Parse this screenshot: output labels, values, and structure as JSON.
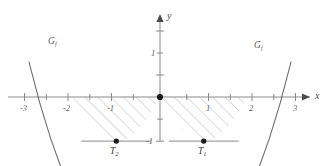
{
  "figure": {
    "background_color": "#ffffff",
    "axis_color": "#8a8a8a",
    "curve_color": "#6e6e6e",
    "hatch_color": "#9a9a9a",
    "point_color": "#1b1b1b"
  },
  "axes": {
    "x_axis_label": "x",
    "y_axis_label": "y",
    "x_ticks_labeled": [
      {
        "value": -3,
        "label": "-3"
      },
      {
        "value": -2,
        "label": "-2"
      },
      {
        "value": -1,
        "label": "-1"
      },
      {
        "value": 1,
        "label": "1"
      },
      {
        "value": 2,
        "label": "2"
      },
      {
        "value": 3,
        "label": "3"
      }
    ],
    "x_ticks_unlabeled": [
      -3.5,
      -2.5,
      -1.5,
      -0.5,
      0.5,
      1.5,
      2.5,
      3.5
    ],
    "y_ticks_labeled": [
      {
        "value": 1,
        "label": "1"
      },
      {
        "value": -1,
        "label": "-1"
      }
    ],
    "y_ticks_unlabeled": [
      1.5,
      0.5,
      -0.5
    ],
    "xlim": [
      -3.6,
      3.6
    ],
    "ylim": [
      -1.4,
      1.9
    ]
  },
  "chart_data": {
    "type": "line",
    "title": "",
    "xlabel": "x",
    "ylabel": "y",
    "xlim": [
      -3.6,
      3.6
    ],
    "ylim": [
      -1.4,
      1.9
    ],
    "grid": false,
    "legend": "none",
    "series": [
      {
        "name": "Gf right branch",
        "expression": "f(x) = x^2 - 2x for x >= 0",
        "x": [
          0,
          0.25,
          0.5,
          0.75,
          1,
          1.25,
          1.5,
          1.75,
          2,
          2.25,
          2.5,
          2.75,
          3
        ],
        "y": [
          0,
          -0.4375,
          -0.75,
          -0.9375,
          -1,
          -0.9375,
          -0.75,
          -0.4375,
          0,
          0.5625,
          1.25,
          2.0625,
          3
        ]
      },
      {
        "name": "Gf left branch",
        "expression": "f(x) = x^2 + 2x for x <= 0",
        "x": [
          -3,
          -2.75,
          -2.5,
          -2.25,
          -2,
          -1.75,
          -1.5,
          -1.25,
          -1,
          -0.75,
          -0.5,
          -0.25,
          0
        ],
        "y": [
          3,
          2.0625,
          1.25,
          0.5625,
          0,
          -0.4375,
          -0.75,
          -0.9375,
          -1,
          -0.9375,
          -0.75,
          -0.4375,
          0
        ]
      }
    ],
    "annotations": [
      {
        "text": "G_f",
        "label": "Gf",
        "x": -2.5,
        "y": 1.3
      },
      {
        "text": "G_f",
        "label": "Gf",
        "x": 2.25,
        "y": 1.2
      },
      {
        "text": "T_2",
        "label": "T2",
        "x": -1,
        "y": -1
      },
      {
        "text": "T_1",
        "label": "T1",
        "x": 1,
        "y": -1
      }
    ],
    "marked_points": [
      {
        "name": "origin",
        "x": 0,
        "y": 0
      },
      {
        "name": "T2",
        "x": -1,
        "y": -1
      },
      {
        "name": "T1",
        "x": 1,
        "y": -1
      }
    ],
    "tangent_lines": [
      {
        "at_point": "T2",
        "slope": 0,
        "y": -1,
        "x_from": -1.8,
        "x_to": -0.2
      },
      {
        "at_point": "T1",
        "slope": 0,
        "y": -1,
        "x_from": 0.2,
        "x_to": 1.8
      }
    ],
    "shaded_regions": [
      {
        "name": "left-region",
        "style": "hatched",
        "x_from": -2,
        "x_to": 0,
        "between": "curve and x-axis"
      },
      {
        "name": "right-region",
        "style": "hatched",
        "x_from": 0,
        "x_to": 2,
        "between": "curve and x-axis"
      }
    ]
  },
  "labels": {
    "x_axis": "x",
    "y_axis": "y",
    "curve_left": "G",
    "curve_left_sub": "f",
    "curve_right": "G",
    "curve_right_sub": "f",
    "point_t1": "T",
    "point_t1_sub": "1",
    "point_t2": "T",
    "point_t2_sub": "2",
    "tick_neg3": "-3",
    "tick_neg2": "-2",
    "tick_neg1": "-1",
    "tick_pos1": "1",
    "tick_pos2": "2",
    "tick_pos3": "3",
    "tick_y1": "1",
    "tick_yneg1": "-1"
  }
}
